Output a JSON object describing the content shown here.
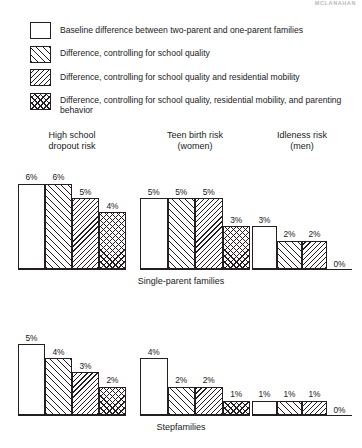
{
  "running_header": "MCLANAHAN",
  "legend": {
    "items": [
      {
        "pattern": "blank",
        "label": "Baseline difference between two-parent and one-parent families"
      },
      {
        "pattern": "forward-hatch",
        "label": "Difference, controlling for school quality"
      },
      {
        "pattern": "backward-hatch",
        "label": "Difference, controlling for school quality and residential mobility"
      },
      {
        "pattern": "crosshatch",
        "label": "Difference, controlling for school quality, residential mobility, and parenting behavior"
      }
    ]
  },
  "chart_data": {
    "type": "bar",
    "title": "",
    "xlabel": "",
    "ylabel": "",
    "ylim": [
      0,
      6
    ],
    "grid": false,
    "legend_position": "top",
    "series": [
      {
        "name": "Baseline difference between two-parent and one-parent families",
        "pattern": "blank"
      },
      {
        "name": "Difference, controlling for school quality",
        "pattern": "forward-hatch"
      },
      {
        "name": "Difference, controlling for school quality and residential mobility",
        "pattern": "backward-hatch"
      },
      {
        "name": "Difference, controlling for school quality, residential mobility, and parenting behavior",
        "pattern": "crosshatch"
      }
    ],
    "panels": [
      {
        "label": "Single-parent families",
        "groups": [
          {
            "title": "High school\ndropout risk",
            "title_line1": "High school",
            "title_line2": "dropout risk",
            "values": [
              6,
              6,
              5,
              4
            ],
            "labels": [
              "6%",
              "6%",
              "5%",
              "4%"
            ]
          },
          {
            "title_line1": "Teen birth risk",
            "title_line2": "(women)",
            "values": [
              5,
              5,
              5,
              3
            ],
            "labels": [
              "5%",
              "5%",
              "5%",
              "3%"
            ]
          },
          {
            "title_line1": "Idleness risk",
            "title_line2": "(men)",
            "values": [
              3,
              2,
              2,
              0
            ],
            "labels": [
              "3%",
              "2%",
              "2%",
              "0%"
            ]
          }
        ]
      },
      {
        "label": "Stepfamilies",
        "groups": [
          {
            "title_line1": "",
            "title_line2": "",
            "values": [
              5,
              4,
              3,
              2
            ],
            "labels": [
              "5%",
              "4%",
              "3%",
              "2%"
            ]
          },
          {
            "title_line1": "",
            "title_line2": "",
            "values": [
              4,
              2,
              2,
              1
            ],
            "labels": [
              "4%",
              "2%",
              "2%",
              "1%"
            ]
          },
          {
            "title_line1": "",
            "title_line2": "",
            "values": [
              1,
              1,
              1,
              0
            ],
            "labels": [
              "1%",
              "1%",
              "1%",
              "0%"
            ]
          }
        ]
      }
    ]
  }
}
